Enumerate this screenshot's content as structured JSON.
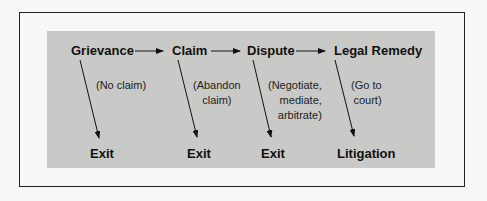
{
  "diagram": {
    "stages": [
      {
        "label": "Grievance",
        "exit_note": "(No claim)",
        "outcome": "Exit"
      },
      {
        "label": "Claim",
        "exit_note": "(Abandon\nclaim)",
        "outcome": "Exit"
      },
      {
        "label": "Dispute",
        "exit_note": "(Negotiate,\nmediate,\narbitrate)",
        "outcome": "Exit"
      },
      {
        "label": "Legal Remedy",
        "exit_note": "(Go to\ncourt)",
        "outcome": "Litigation"
      }
    ],
    "colors": {
      "panel": "#c9c9c7",
      "frame": "#222222",
      "background": "#f7f7f5"
    }
  }
}
